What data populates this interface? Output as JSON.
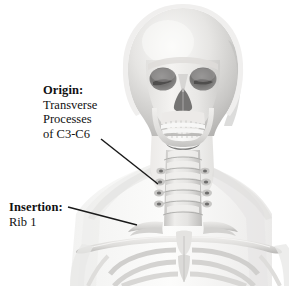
{
  "figure": {
    "background_color": "#ffffff",
    "width": 289,
    "height": 286
  },
  "annotations": {
    "origin": {
      "heading": "Origin:",
      "lines": [
        "Transverse",
        "Processes",
        "of C3-C6"
      ],
      "line1": "Transverse",
      "line2": "Processes",
      "line3": "of C3-C6",
      "leader_color": "#1a1a1a"
    },
    "insertion": {
      "heading": "Insertion:",
      "lines": [
        "Rib 1"
      ],
      "line1": "Rib 1",
      "leader_color": "#1a1a1a"
    }
  },
  "artwork": {
    "type": "grayscale-anatomical-render",
    "parts": [
      "cranium",
      "orbits",
      "nasal-aperture",
      "maxilla",
      "mandible",
      "teeth",
      "cervical-vertebrae",
      "clavicle-left",
      "clavicle-right",
      "sternum",
      "ribcage",
      "scapula-left",
      "scapula-right",
      "soft-tissue-silhouette"
    ],
    "bone_light": "#f2f1ef",
    "bone_mid": "#d9d8d6",
    "bone_shadow": "#a9a8a6",
    "cavity_dark": "#6f6e6d",
    "silhouette": "#f6f6f5"
  }
}
